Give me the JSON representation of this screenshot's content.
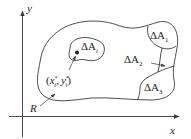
{
  "diagram": {
    "type": "region-partition",
    "colors": {
      "stroke": "#3a3a3a",
      "text": "#231f20",
      "background": "#ffffff"
    },
    "axes": {
      "x_label": "x",
      "y_label": "y"
    },
    "region_label": "R",
    "subregions": [
      {
        "id": "dA_i",
        "delta": "ΔA",
        "sub": "i"
      },
      {
        "id": "dA_1",
        "delta": "ΔA",
        "sub": "1"
      },
      {
        "id": "dA_2",
        "delta": "ΔA",
        "sub": "2"
      },
      {
        "id": "dA_3",
        "delta": "ΔA",
        "sub": "3"
      }
    ],
    "sample_point": {
      "open": "(",
      "x": "x",
      "x_sub": "i",
      "x_sup": "*",
      "comma": ",",
      "y": "y",
      "y_sub": "i",
      "y_sup": "*",
      "close": ")"
    }
  }
}
